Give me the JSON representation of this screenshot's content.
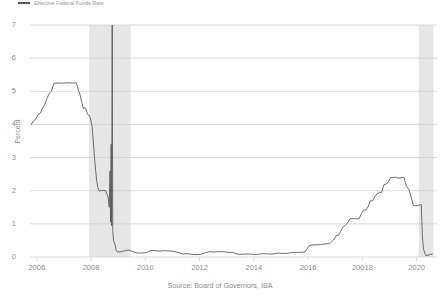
{
  "legend": {
    "key_color": "#555555",
    "label": "Effective Federal Funds Rate"
  },
  "axes": {
    "ylabel": "Percent",
    "yticks": [
      "0",
      "1",
      "2",
      "3",
      "4",
      "5",
      "6",
      "7"
    ],
    "xticks": [
      "2006",
      "2008",
      "2010",
      "2012",
      "2014",
      "2016",
      "20018",
      "2020"
    ]
  },
  "source": "Source: Board of Governors, IBA",
  "colors": {
    "line": "#555555",
    "grid": "#cccccc",
    "recession_band": "#e6e6e6",
    "text": "#8c8c8c",
    "background": "#ffffff"
  },
  "chart_data": {
    "type": "line",
    "title": "",
    "subtitle": "",
    "xlabel": "",
    "ylabel": "Percent",
    "xlim": [
      2005.75,
      2020.75
    ],
    "ylim": [
      0,
      7
    ],
    "grid": true,
    "legend_position": "top-left",
    "xticks": [
      2006,
      2008,
      2010,
      2012,
      2014,
      2016,
      2018,
      2020
    ],
    "xtick_labels": [
      "2006",
      "2008",
      "2010",
      "2012",
      "2014",
      "2016",
      "20018",
      "2020"
    ],
    "yticks": [
      0,
      1,
      2,
      3,
      4,
      5,
      6,
      7
    ],
    "series": [
      {
        "name": "Effective Federal Funds Rate",
        "color": "#555555",
        "x": [
          2005.79,
          2005.88,
          2005.96,
          2006.04,
          2006.13,
          2006.21,
          2006.29,
          2006.38,
          2006.46,
          2006.54,
          2006.63,
          2006.71,
          2006.79,
          2006.88,
          2006.96,
          2007.04,
          2007.13,
          2007.21,
          2007.29,
          2007.38,
          2007.46,
          2007.54,
          2007.58,
          2007.63,
          2007.67,
          2007.71,
          2007.79,
          2007.88,
          2007.96,
          2008.04,
          2008.08,
          2008.13,
          2008.17,
          2008.21,
          2008.25,
          2008.29,
          2008.33,
          2008.38,
          2008.46,
          2008.54,
          2008.63,
          2008.67,
          2008.7,
          2008.72,
          2008.74,
          2008.76,
          2008.78,
          2008.8,
          2008.83,
          2008.88,
          2008.92,
          2008.96,
          2009.04,
          2009.21,
          2009.38,
          2009.54,
          2009.71,
          2009.88,
          2010.04,
          2010.21,
          2010.38,
          2010.54,
          2010.71,
          2010.88,
          2011.04,
          2011.21,
          2011.38,
          2011.54,
          2011.71,
          2011.88,
          2012.04,
          2012.21,
          2012.38,
          2012.54,
          2012.71,
          2012.88,
          2013.04,
          2013.21,
          2013.38,
          2013.54,
          2013.71,
          2013.88,
          2014.04,
          2014.21,
          2014.38,
          2014.54,
          2014.71,
          2014.88,
          2015.04,
          2015.21,
          2015.38,
          2015.54,
          2015.71,
          2015.88,
          2015.96,
          2016.04,
          2016.13,
          2016.29,
          2016.46,
          2016.63,
          2016.79,
          2016.96,
          2017.04,
          2017.13,
          2017.21,
          2017.29,
          2017.38,
          2017.46,
          2017.54,
          2017.63,
          2017.71,
          2017.79,
          2017.88,
          2017.96,
          2018.04,
          2018.13,
          2018.21,
          2018.29,
          2018.38,
          2018.46,
          2018.54,
          2018.63,
          2018.71,
          2018.79,
          2018.88,
          2018.96,
          2019.04,
          2019.13,
          2019.21,
          2019.29,
          2019.38,
          2019.46,
          2019.54,
          2019.58,
          2019.63,
          2019.71,
          2019.79,
          2019.88,
          2019.96,
          2020.04,
          2020.13,
          2020.17,
          2020.19,
          2020.21,
          2020.25,
          2020.33,
          2020.42,
          2020.5,
          2020.58
        ],
        "y": [
          4.0,
          4.1,
          4.16,
          4.29,
          4.34,
          4.49,
          4.59,
          4.79,
          4.94,
          5.0,
          5.24,
          5.25,
          5.25,
          5.25,
          5.24,
          5.25,
          5.26,
          5.25,
          5.25,
          5.25,
          5.26,
          5.02,
          4.94,
          4.76,
          4.64,
          4.49,
          4.5,
          4.3,
          4.24,
          3.94,
          3.5,
          2.98,
          2.61,
          2.28,
          2.1,
          2.0,
          2.0,
          2.0,
          2.01,
          2.0,
          1.81,
          1.5,
          2.6,
          1.05,
          3.4,
          0.95,
          7.0,
          0.8,
          0.5,
          0.39,
          0.22,
          0.16,
          0.15,
          0.18,
          0.21,
          0.16,
          0.12,
          0.12,
          0.13,
          0.2,
          0.19,
          0.18,
          0.19,
          0.18,
          0.17,
          0.14,
          0.09,
          0.1,
          0.08,
          0.07,
          0.08,
          0.13,
          0.16,
          0.15,
          0.16,
          0.16,
          0.14,
          0.14,
          0.09,
          0.08,
          0.09,
          0.09,
          0.07,
          0.09,
          0.1,
          0.09,
          0.09,
          0.12,
          0.11,
          0.11,
          0.13,
          0.14,
          0.14,
          0.15,
          0.24,
          0.34,
          0.36,
          0.37,
          0.37,
          0.4,
          0.4,
          0.54,
          0.65,
          0.66,
          0.79,
          0.91,
          0.96,
          1.04,
          1.15,
          1.16,
          1.16,
          1.15,
          1.16,
          1.3,
          1.41,
          1.42,
          1.51,
          1.69,
          1.7,
          1.82,
          1.91,
          1.95,
          1.95,
          2.18,
          2.2,
          2.27,
          2.4,
          2.4,
          2.41,
          2.39,
          2.38,
          2.4,
          2.4,
          2.25,
          2.13,
          2.04,
          1.83,
          1.55,
          1.55,
          1.55,
          1.58,
          1.58,
          1.1,
          0.65,
          0.25,
          0.05,
          0.05,
          0.08,
          0.09
        ]
      }
    ],
    "recession_bands": [
      {
        "start": 2007.92,
        "end": 2009.46,
        "label": "2008 recession"
      },
      {
        "start": 2020.08,
        "end": 2020.62,
        "label": "2020 recession"
      }
    ]
  }
}
